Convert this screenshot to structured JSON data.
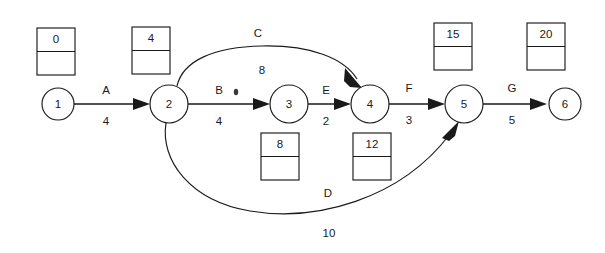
{
  "diagram": {
    "background_color": "#ffffff",
    "stroke_color": "#1a1a1a",
    "nodes": [
      {
        "id": "n1",
        "label": "1",
        "cx": 58,
        "cy": 104,
        "r": 16
      },
      {
        "id": "n2",
        "label": "2",
        "cx": 169,
        "cy": 104,
        "r": 19
      },
      {
        "id": "n3",
        "label": "3",
        "cx": 289,
        "cy": 104,
        "r": 19
      },
      {
        "id": "n4",
        "label": "4",
        "cx": 370,
        "cy": 104,
        "r": 19
      },
      {
        "id": "n5",
        "label": "5",
        "cx": 464,
        "cy": 104,
        "r": 19
      },
      {
        "id": "n6",
        "label": "6",
        "cx": 565,
        "cy": 104,
        "r": 16
      }
    ],
    "boxes": [
      {
        "id": "b1",
        "value": "0",
        "x": 37,
        "y": 28,
        "w": 38,
        "h": 47
      },
      {
        "id": "b2",
        "value": "4",
        "x": 132,
        "y": 27,
        "w": 38,
        "h": 47
      },
      {
        "id": "b3",
        "value": "15",
        "x": 434,
        "y": 23,
        "w": 38,
        "h": 47
      },
      {
        "id": "b4",
        "value": "20",
        "x": 527,
        "y": 23,
        "w": 38,
        "h": 47
      },
      {
        "id": "b5",
        "value": "8",
        "x": 261,
        "y": 133,
        "w": 38,
        "h": 47
      },
      {
        "id": "b6",
        "value": "12",
        "x": 353,
        "y": 133,
        "w": 38,
        "h": 47
      }
    ],
    "edges": [
      {
        "id": "eA",
        "name": "A",
        "weight": "4",
        "from": "1",
        "to": "2",
        "name_x": 106,
        "name_y": 91,
        "weight_x": 106,
        "weight_y": 122
      },
      {
        "id": "eB",
        "name": "B",
        "weight": "4",
        "from": "2",
        "to": "3",
        "name_x": 219,
        "name_y": 91,
        "weight_x": 219,
        "weight_y": 122
      },
      {
        "id": "eE",
        "name": "E",
        "weight": "2",
        "from": "3",
        "to": "4",
        "name_x": 326,
        "name_y": 91,
        "weight_x": 326,
        "weight_y": 122
      },
      {
        "id": "eF",
        "name": "F",
        "weight": "3",
        "from": "4",
        "to": "5",
        "name_x": 409,
        "name_y": 89,
        "weight_x": 409,
        "weight_y": 121
      },
      {
        "id": "eG",
        "name": "G",
        "weight": "5",
        "from": "5",
        "to": "6",
        "name_x": 512,
        "name_y": 89,
        "weight_x": 512,
        "weight_y": 121
      },
      {
        "id": "eC",
        "name": "C",
        "weight": "8",
        "from": "2",
        "to": "4",
        "name_x": 258,
        "name_y": 34,
        "weight_x": 262,
        "weight_y": 71
      },
      {
        "id": "eD",
        "name": "D",
        "weight": "10",
        "from": "2",
        "to": "5",
        "name_x": 328,
        "name_y": 194,
        "weight_x": 329,
        "weight_y": 234
      }
    ]
  }
}
